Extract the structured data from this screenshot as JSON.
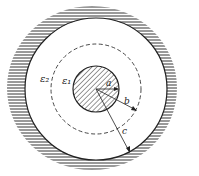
{
  "diagram": {
    "type": "coaxial-dielectric-cross-section",
    "labels": {
      "epsilon_outer": "ε₂",
      "epsilon_inner": "ε₁",
      "radius_a": "a",
      "radius_b": "b",
      "radius_c": "c"
    },
    "geometry": {
      "center": [
        96,
        89
      ],
      "inner_conductor_radius": 23,
      "dielectric_boundary_radius": 45,
      "outer_conductor_radius": 71
    },
    "colors": {
      "line": "#222222",
      "hatch": "#333333",
      "background": "#ffffff"
    }
  }
}
